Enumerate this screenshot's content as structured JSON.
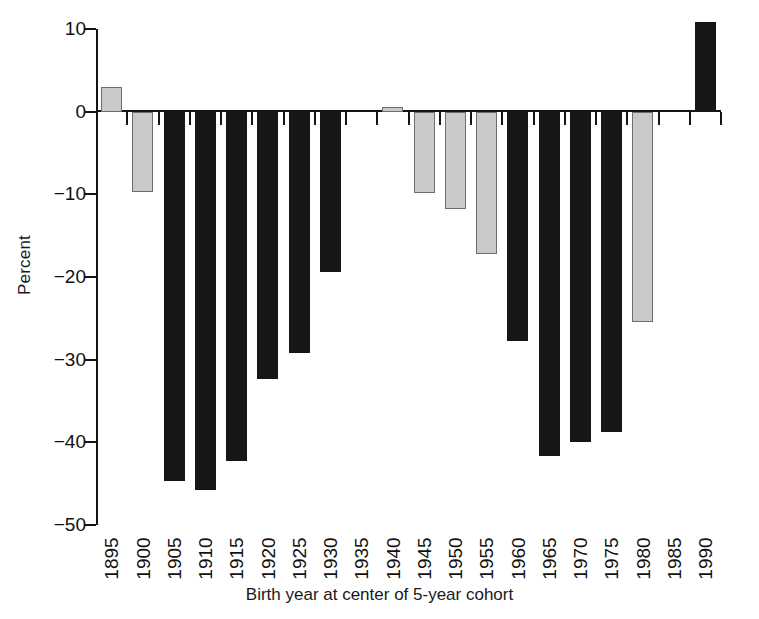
{
  "chart_data": {
    "type": "bar",
    "title": "",
    "subtitle": "",
    "xlabel": "Birth year at center of 5-year cohort",
    "ylabel": "Percent",
    "categories": [
      "1895",
      "1900",
      "1905",
      "1910",
      "1915",
      "1920",
      "1925",
      "1930",
      "1935",
      "1940",
      "1945",
      "1950",
      "1955",
      "1960",
      "1965",
      "1970",
      "1975",
      "1980",
      "1985",
      "1990"
    ],
    "values": [
      3.0,
      -9.7,
      -44.7,
      -45.8,
      -42.2,
      -32.4,
      -29.2,
      -19.4,
      0.0,
      0.6,
      -9.8,
      -11.8,
      -17.2,
      -27.7,
      -41.6,
      -40.0,
      -38.8,
      -25.5,
      0.0,
      10.8
    ],
    "bar_colors": [
      "light",
      "light",
      "dark",
      "dark",
      "dark",
      "dark",
      "dark",
      "dark",
      "none",
      "light",
      "light",
      "light",
      "light",
      "dark",
      "dark",
      "dark",
      "dark",
      "light",
      "none",
      "dark"
    ],
    "ylim": [
      -50,
      10
    ],
    "yticks": [
      10,
      0,
      -10,
      -20,
      -30,
      -40,
      -50
    ],
    "ytick_labels": [
      "10",
      "0",
      "−10",
      "−20",
      "−30",
      "−40",
      "−50"
    ],
    "xtick_rotation": 90,
    "grid": false,
    "legend": "none",
    "colors": {
      "dark_bar": "#161616",
      "light_bar": "#c9c9c9",
      "light_bar_edge": "#6e6e6e",
      "axis": "#141414",
      "text": "#1a1a1a",
      "background": "#ffffff"
    }
  }
}
